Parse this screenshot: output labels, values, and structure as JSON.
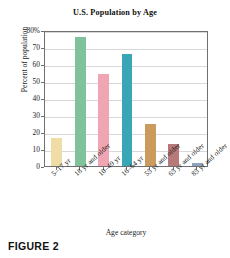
{
  "figure": {
    "caption": "FIGURE 2"
  },
  "chart_data": {
    "type": "bar",
    "title": "U.S. Population by Age",
    "xlabel": "Age category",
    "ylabel": "Percent of population",
    "categories": [
      "5–17 yr",
      "18 yr and older",
      "10–49 yr",
      "16–64 yr",
      "55 yr and older",
      "65 yr and older",
      "85 yr and older"
    ],
    "values": [
      16.5,
      76,
      54,
      66,
      25,
      13,
      1.5
    ],
    "colors": [
      "#f0dca5",
      "#80c29a",
      "#efa6b2",
      "#38a6b4",
      "#ca9b5c",
      "#b87a78",
      "#8fa3bd"
    ],
    "ylim": [
      0,
      80
    ],
    "yticks": [
      0,
      10,
      20,
      30,
      40,
      50,
      60,
      70,
      80
    ],
    "ytick_labels": [
      "0",
      "10",
      "20",
      "30",
      "40",
      "50",
      "60",
      "70",
      "80%"
    ],
    "grid": true,
    "legend": "none"
  }
}
